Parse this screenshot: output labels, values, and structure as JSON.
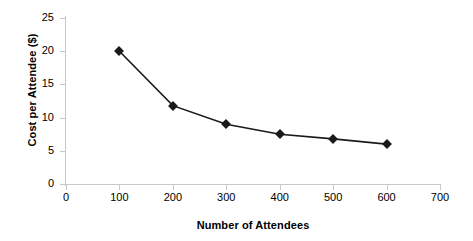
{
  "chart_data": {
    "type": "line",
    "title": "",
    "xlabel": "Number of Attendees",
    "ylabel": "Cost per Attendee ($)",
    "x": [
      100,
      200,
      300,
      400,
      500,
      600
    ],
    "values": [
      20,
      11.8,
      9.0,
      7.5,
      6.8,
      6.0
    ],
    "series": [
      {
        "name": "Cost per Attendee",
        "values": [
          20,
          11.8,
          9.0,
          7.5,
          6.8,
          6.0
        ],
        "marker": "diamond",
        "color": "#1a1a1a"
      }
    ],
    "xlim": [
      0,
      700
    ],
    "ylim": [
      0,
      25
    ],
    "xticks": [
      0,
      100,
      200,
      300,
      400,
      500,
      600,
      700
    ],
    "yticks": [
      0,
      5,
      10,
      15,
      20,
      25
    ],
    "xtick_labels": [
      "0",
      "100",
      "200",
      "300",
      "400",
      "500",
      "600",
      "700"
    ],
    "ytick_labels": [
      "0",
      "5",
      "10",
      "15",
      "20",
      "25"
    ],
    "grid": false,
    "legend": false,
    "legend_position": "none",
    "axis_color": "#c8c8c8",
    "line_color": "#1a1a1a",
    "background": "#ffffff"
  }
}
